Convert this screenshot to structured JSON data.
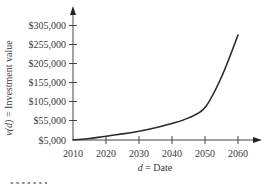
{
  "chart_data": {
    "type": "line",
    "title": "",
    "xlabel": "d = Date",
    "xlabel_var": "d",
    "xlabel_text": " = Date",
    "ylabel": "v(d) = Investment value",
    "ylabel_var": "v(d)",
    "ylabel_text": " = Investment value",
    "x_ticks": [
      "2010",
      "2020",
      "2030",
      "2040",
      "2050",
      "2060"
    ],
    "y_ticks": [
      "$5,000",
      "$55,000",
      "$105,000",
      "$155,000",
      "$205,000",
      "$255,000",
      "$305,000"
    ],
    "xlim": [
      2010,
      2063
    ],
    "ylim": [
      5000,
      320000
    ],
    "grid": false,
    "legend": null,
    "series": [
      {
        "name": "v(d)",
        "x": [
          2010,
          2015,
          2020,
          2025,
          2030,
          2035,
          2040,
          2045,
          2050,
          2055,
          2060
        ],
        "values": [
          5000,
          9000,
          15000,
          21000,
          28000,
          37000,
          48000,
          63000,
          90000,
          170000,
          280000
        ]
      }
    ],
    "color": "#2b2b2b"
  },
  "footer": {
    "text": "▪ ▪ ▪ ▪ ▪ ▪ ▪"
  }
}
